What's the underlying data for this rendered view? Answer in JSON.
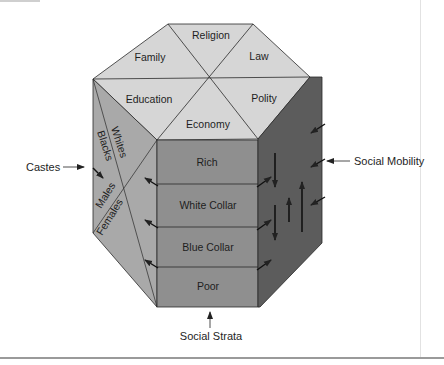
{
  "diagram": {
    "type": "prism-of-social-institutions",
    "top_face": {
      "segments": [
        "Religion",
        "Family",
        "Law",
        "Education",
        "Polity",
        "Economy"
      ]
    },
    "left_face": {
      "dividers": [
        "Whites",
        "Blacks",
        "Males",
        "Females"
      ]
    },
    "front_face": {
      "strata": [
        "Rich",
        "White Collar",
        "Blue Collar",
        "Poor"
      ]
    },
    "right_face": {
      "description": "vertical up/down arrows and diagonal arrows indicating mobility"
    },
    "external_labels": {
      "castes": "Castes",
      "social_mobility": "Social Mobility",
      "social_strata": "Social Strata"
    },
    "colors": {
      "top_face": "#d6d6d6",
      "left_face": "#a9a9a9",
      "front_face": "#8f8f8f",
      "right_face": "#5c5c5c",
      "edges": "#2a2a2a",
      "text": "#1e1e1e"
    }
  }
}
